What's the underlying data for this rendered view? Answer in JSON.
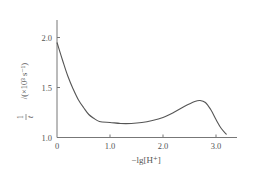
{
  "chart_data": {
    "type": "line",
    "title": "",
    "xlabel": "−lg[H⁺]",
    "ylabel": "1/t / (×10³ s⁻¹)",
    "ylabel_parts": {
      "fraction_num": "1",
      "fraction_den": "t",
      "unit": "/(×10³ s⁻¹)"
    },
    "xlim": [
      0,
      3.4
    ],
    "ylim": [
      1.0,
      2.2
    ],
    "xticks": [
      0,
      1.0,
      2.0,
      3.0
    ],
    "xtick_labels": [
      "0",
      "1.0",
      "2.0",
      "3.0"
    ],
    "yticks": [
      1.0,
      1.5,
      2.0
    ],
    "ytick_labels": [
      "1.0",
      "1.5",
      "2.0"
    ],
    "grid": false,
    "legend": null,
    "series": [
      {
        "name": "1/t",
        "color": "#555555",
        "x": [
          0.0,
          0.1,
          0.2,
          0.3,
          0.4,
          0.5,
          0.6,
          0.7,
          0.8,
          1.0,
          1.2,
          1.4,
          1.6,
          1.8,
          2.0,
          2.2,
          2.4,
          2.6,
          2.7,
          2.8,
          2.9,
          3.0,
          3.1,
          3.2
        ],
        "y": [
          1.95,
          1.78,
          1.62,
          1.49,
          1.38,
          1.3,
          1.23,
          1.19,
          1.16,
          1.15,
          1.14,
          1.14,
          1.15,
          1.17,
          1.2,
          1.25,
          1.31,
          1.36,
          1.37,
          1.35,
          1.28,
          1.18,
          1.09,
          1.03
        ]
      }
    ]
  }
}
